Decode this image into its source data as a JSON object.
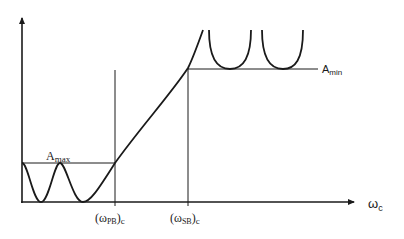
{
  "figure": {
    "type": "filter-attenuation-specification",
    "colors": {
      "ink": "#1a1a1a",
      "background": "#ffffff"
    },
    "axes": {
      "x_label": {
        "main": "ω",
        "sub": "c"
      },
      "y_label": ""
    },
    "levels": {
      "a_max": {
        "main": "A",
        "sub": "max"
      },
      "a_min": {
        "main": "A",
        "sub": "min"
      }
    },
    "x_ticks": [
      {
        "open": "(ω",
        "sub": "PB",
        "close": ")",
        "subc": "c"
      },
      {
        "open": "(ω",
        "sub": "SB",
        "close": ")",
        "subc": "c"
      }
    ],
    "regions": [
      "passband (equiripple up to A_max)",
      "transition band",
      "stopband (attenuation above A_min)"
    ]
  }
}
